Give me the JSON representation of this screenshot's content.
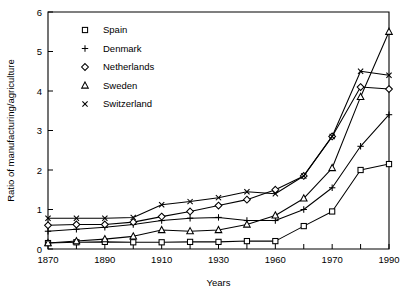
{
  "chart_data": {
    "type": "line",
    "title": "",
    "xlabel": "Years",
    "ylabel": "Ratio of manufacturing/agriculture",
    "ylim": [
      0,
      6
    ],
    "yticks": [
      0,
      1,
      2,
      3,
      4,
      5,
      6
    ],
    "ytick_labels": [
      "0",
      "1",
      "2",
      "3",
      "4",
      "5",
      "6"
    ],
    "x": [
      1870,
      1880,
      1890,
      1900,
      1910,
      1920,
      1930,
      1945,
      1960,
      1965,
      1970,
      1980,
      1988
    ],
    "xtick_labels": [
      "1870",
      "1890",
      "1910",
      "1930",
      "1960",
      "1970",
      "1990"
    ],
    "xticks_labeled": [
      1870,
      1890,
      1910,
      1930,
      1960,
      1970,
      1990
    ],
    "xticks_minor": [
      1880,
      1900,
      1920,
      1945,
      1965,
      1980
    ],
    "grid": false,
    "legend_position": "top-left",
    "series": [
      {
        "name": "Spain",
        "marker": "square",
        "values": [
          0.15,
          0.17,
          0.18,
          0.17,
          0.17,
          0.18,
          0.18,
          0.2,
          0.2,
          0.58,
          0.95,
          2.0,
          2.15
        ]
      },
      {
        "name": "Denmark",
        "marker": "plus",
        "values": [
          0.45,
          0.5,
          0.55,
          0.62,
          0.72,
          0.78,
          0.8,
          0.72,
          0.72,
          1.0,
          1.55,
          2.6,
          3.4
        ]
      },
      {
        "name": "Netherlands",
        "marker": "diamond",
        "values": [
          0.6,
          0.62,
          0.62,
          0.68,
          0.82,
          0.95,
          1.1,
          1.25,
          1.5,
          1.85,
          2.85,
          4.1,
          4.05
        ]
      },
      {
        "name": "Sweden",
        "marker": "triangle",
        "values": [
          0.15,
          0.2,
          0.25,
          0.32,
          0.48,
          0.45,
          0.48,
          0.62,
          0.85,
          1.28,
          2.05,
          3.85,
          5.5
        ]
      },
      {
        "name": "Switzerland",
        "marker": "cross",
        "values": [
          0.78,
          0.78,
          0.78,
          0.8,
          1.12,
          1.2,
          1.3,
          1.45,
          1.4,
          1.85,
          2.85,
          4.5,
          4.4
        ]
      }
    ]
  },
  "legend": {
    "entries": [
      {
        "label": "Spain",
        "marker": "square"
      },
      {
        "label": "Denmark",
        "marker": "plus"
      },
      {
        "label": "Netherlands",
        "marker": "diamond"
      },
      {
        "label": "Sweden",
        "marker": "triangle"
      },
      {
        "label": "Switzerland",
        "marker": "cross"
      }
    ]
  },
  "axes": {
    "x_title": "Years",
    "y_title": "Ratio of manufacturing/agriculture"
  }
}
